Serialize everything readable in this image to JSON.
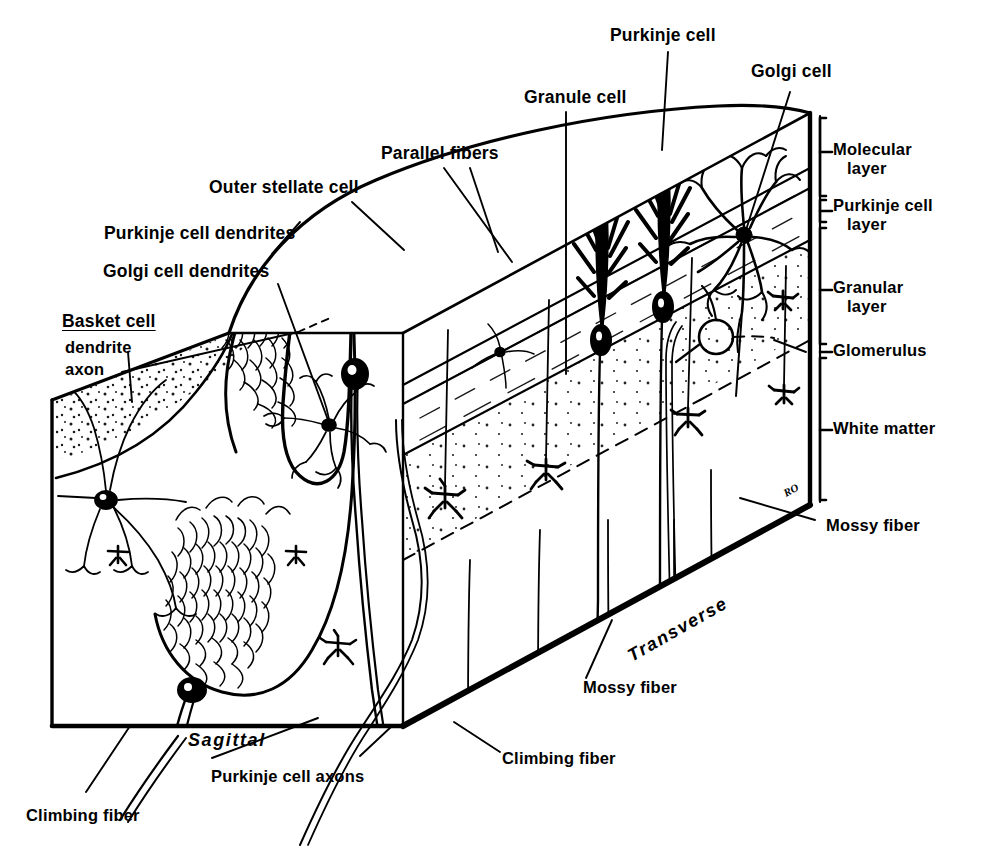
{
  "figure": {
    "signature": "RO",
    "ink_color": "#000000",
    "paper_color": "#ffffff"
  },
  "orientation_labels": [
    {
      "id": "sagittal",
      "text": "Sagittal",
      "style": "italic"
    },
    {
      "id": "transverse",
      "text": "Transverse",
      "style": "italic"
    }
  ],
  "layer_labels": [
    {
      "id": "molecular-layer",
      "line1": "Molecular",
      "line2": "layer"
    },
    {
      "id": "purkinje-cell-layer",
      "line1": "Purkinje cell",
      "line2": "layer"
    },
    {
      "id": "granular-layer",
      "line1": "Granular",
      "line2": "layer"
    },
    {
      "id": "glomerulus",
      "line1": "Glomerulus",
      "line2": ""
    },
    {
      "id": "white-matter",
      "line1": "White matter",
      "line2": ""
    }
  ],
  "cell_labels": [
    {
      "id": "purkinje-cell",
      "text": "Purkinje cell"
    },
    {
      "id": "golgi-cell",
      "text": "Golgi cell"
    },
    {
      "id": "granule-cell",
      "text": "Granule cell"
    },
    {
      "id": "parallel-fibers",
      "text": "Parallel fibers"
    },
    {
      "id": "outer-stellate-cell",
      "text": "Outer stellate cell"
    },
    {
      "id": "purkinje-cell-dendrites",
      "text": "Purkinje cell dendrites"
    },
    {
      "id": "golgi-cell-dendrites",
      "text": "Golgi cell dendrites"
    }
  ],
  "basket_cell": {
    "heading": "Basket cell",
    "parts": [
      "dendrite",
      "axon"
    ]
  },
  "fiber_labels": [
    {
      "id": "mossy-fiber-right",
      "text": "Mossy fiber"
    },
    {
      "id": "mossy-fiber-bottom",
      "text": "Mossy fiber"
    },
    {
      "id": "climbing-fiber-right",
      "text": "Climbing fiber"
    },
    {
      "id": "climbing-fiber-left",
      "text": "Climbing fiber"
    },
    {
      "id": "purkinje-cell-axons",
      "text": "Purkinje cell axons"
    }
  ]
}
